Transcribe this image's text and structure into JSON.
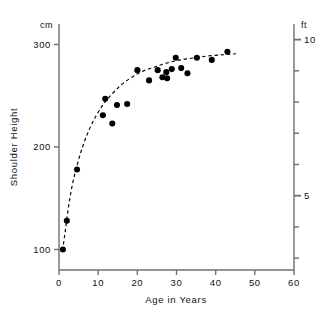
{
  "chart_data": {
    "type": "scatter",
    "title": "",
    "xlabel": "Age in Years",
    "ylabel": "Shoulder Height",
    "left_axis_unit": "cm",
    "right_axis_unit": "ft",
    "xlim": [
      0,
      60
    ],
    "ylim": [
      80,
      320
    ],
    "right_ylim": [
      2.62,
      10.5
    ],
    "grid": false,
    "legend": null,
    "xticks": [
      0,
      10,
      20,
      30,
      40,
      50,
      60
    ],
    "xticklabels": [
      "0",
      "10",
      "20",
      "30",
      "40",
      "50",
      "60"
    ],
    "yticks": [
      100,
      200,
      300
    ],
    "yticklabels": [
      "100",
      "200",
      "300"
    ],
    "right_yticks": [
      3,
      4,
      5,
      6,
      7,
      8,
      9,
      10
    ],
    "right_yticklabels": [
      "",
      "",
      "5",
      "",
      "",
      "",
      "",
      "10"
    ],
    "series": [
      {
        "name": "Shoulder height observations",
        "marker": "filled-circle",
        "color": "#000000",
        "points": [
          [
            1.0,
            100
          ],
          [
            2.0,
            128
          ],
          [
            4.6,
            178
          ],
          [
            11.2,
            231
          ],
          [
            11.8,
            247
          ],
          [
            13.6,
            223
          ],
          [
            14.8,
            241
          ],
          [
            17.4,
            242
          ],
          [
            20.0,
            275
          ],
          [
            23.0,
            265
          ],
          [
            25.2,
            275
          ],
          [
            26.4,
            268
          ],
          [
            27.4,
            273
          ],
          [
            27.6,
            267
          ],
          [
            28.8,
            276
          ],
          [
            29.8,
            287
          ],
          [
            31.2,
            277
          ],
          [
            32.8,
            272
          ],
          [
            35.2,
            287
          ],
          [
            39.0,
            285
          ],
          [
            43.0,
            293
          ]
        ]
      }
    ],
    "fit_curve": {
      "name": "growth-trend",
      "style": "dashed",
      "color": "#000000",
      "points": [
        [
          0.9,
          99
        ],
        [
          1.6,
          118
        ],
        [
          2.4,
          141
        ],
        [
          3.4,
          163
        ],
        [
          4.6,
          182
        ],
        [
          6.0,
          200
        ],
        [
          7.6,
          216
        ],
        [
          9.4,
          230
        ],
        [
          11.4,
          242
        ],
        [
          13.6,
          252
        ],
        [
          16.0,
          261
        ],
        [
          18.6,
          268
        ],
        [
          21.4,
          274
        ],
        [
          24.4,
          278
        ],
        [
          27.6,
          282
        ],
        [
          31.0,
          285
        ],
        [
          34.6,
          287
        ],
        [
          38.4,
          289
        ],
        [
          42.0,
          290
        ],
        [
          45.2,
          291
        ]
      ]
    }
  },
  "axes": {
    "left_unit": "cm",
    "right_unit": "ft",
    "x_title": "Age in Years",
    "y_title": "Shoulder Height"
  }
}
